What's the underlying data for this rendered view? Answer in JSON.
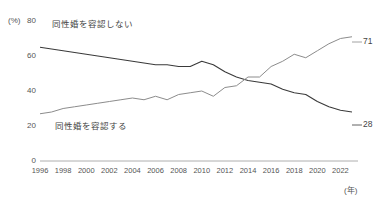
{
  "chart_data": {
    "type": "line",
    "title": "",
    "xlabel": "(年)",
    "ylabel": "(%)",
    "ylim": [
      0,
      80
    ],
    "xlim": [
      1996,
      2023
    ],
    "yticks": [
      0,
      20,
      40,
      60,
      80
    ],
    "xticks": [
      1996,
      1998,
      2000,
      2002,
      2004,
      2006,
      2008,
      2010,
      2012,
      2014,
      2016,
      2018,
      2020,
      2022
    ],
    "grid": false,
    "legend_position": "inline",
    "x": [
      1996,
      1997,
      1998,
      1999,
      2000,
      2001,
      2002,
      2003,
      2004,
      2005,
      2006,
      2007,
      2008,
      2009,
      2010,
      2011,
      2012,
      2013,
      2014,
      2015,
      2016,
      2017,
      2018,
      2019,
      2020,
      2021,
      2022,
      2023
    ],
    "series": [
      {
        "name": "同性婚を容認しない",
        "color": "#3a3a3a",
        "end_value": 28,
        "values": [
          65,
          64,
          63,
          62,
          61,
          60,
          59,
          58,
          57,
          56,
          55,
          55,
          54,
          54,
          57,
          55,
          51,
          48,
          46,
          45,
          44,
          41,
          39,
          38,
          34,
          31,
          29,
          28
        ]
      },
      {
        "name": "同性婚を容認する",
        "color": "#8c8c8c",
        "end_value": 71,
        "values": [
          27,
          28,
          30,
          31,
          32,
          33,
          34,
          35,
          36,
          35,
          37,
          35,
          38,
          39,
          40,
          37,
          42,
          43,
          48,
          48,
          54,
          57,
          61,
          59,
          63,
          67,
          70,
          71
        ]
      }
    ],
    "annotations": [
      {
        "name": "oppose-series-label",
        "text": "同性婚を容認しない"
      },
      {
        "name": "approve-series-label",
        "text": "同性婚を容認する"
      },
      {
        "name": "approve-end-value",
        "text": "71"
      },
      {
        "name": "oppose-end-value",
        "text": "28"
      }
    ]
  },
  "axis": {
    "y_unit": "(%)",
    "x_unit": "(年)",
    "y_labels": [
      "80",
      "60",
      "40",
      "20",
      "0"
    ],
    "x_labels": [
      "1996",
      "1998",
      "2000",
      "2002",
      "2004",
      "2006",
      "2008",
      "2010",
      "2012",
      "2014",
      "2016",
      "2018",
      "2020",
      "2022"
    ]
  },
  "labels": {
    "oppose": "同性婚を容認しない",
    "approve": "同性婚を容認する",
    "approve_end": "71",
    "oppose_end": "28"
  }
}
